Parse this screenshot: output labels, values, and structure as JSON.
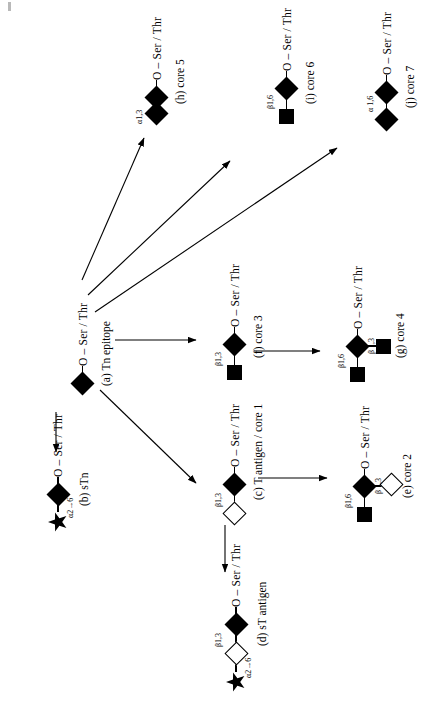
{
  "figure": {
    "type": "glycan-biosynthesis-diagram",
    "orientation": "rotated-90-ccw",
    "aglycone_label": "O – Ser / Thr",
    "symbols": {
      "filled_diamond": "GalNAc",
      "open_diamond": "Gal",
      "filled_square": "GlcNAc",
      "star": "sialic-acid"
    },
    "colors": {
      "ink": "#000000",
      "background": "#ffffff"
    }
  },
  "structures": {
    "tn": {
      "caption": "(a) Tn epitope",
      "aglycone": "O – Ser / Thr",
      "residues": [
        "filled_diamond"
      ],
      "linkages": []
    },
    "stn": {
      "caption": "(b) sTn",
      "aglycone": "O – Ser / Thr",
      "residues": [
        "star",
        "filled_diamond"
      ],
      "linkages": [
        "α2→6"
      ]
    },
    "t_antigen": {
      "caption": "(c) T antigen / core 1",
      "aglycone": "O – Ser / Thr",
      "residues": [
        "open_diamond",
        "filled_diamond"
      ],
      "linkages": [
        "β1,3"
      ]
    },
    "st_antigen": {
      "caption": "(d) sT antigen",
      "aglycone": "O – Ser / Thr",
      "residues": [
        "star",
        "open_diamond",
        "filled_diamond"
      ],
      "linkages": [
        "α2→6",
        "β1,3"
      ]
    },
    "core2": {
      "caption": "(e) core 2",
      "aglycone": "O – Ser / Thr",
      "residues": [
        "filled_square",
        "open_diamond",
        "filled_diamond"
      ],
      "linkages": [
        "β1,6",
        "β 1,3"
      ]
    },
    "core3": {
      "caption": "(f) core 3",
      "aglycone": "O – Ser / Thr",
      "residues": [
        "filled_square",
        "filled_diamond"
      ],
      "linkages": [
        "β1,3"
      ]
    },
    "core4": {
      "caption": "(g) core 4",
      "aglycone": "O – Ser / Thr",
      "residues": [
        "filled_square",
        "filled_square",
        "filled_diamond"
      ],
      "linkages": [
        "β1,6",
        "β 1,3"
      ]
    },
    "core5": {
      "caption": "(h) core 5",
      "aglycone": "O – Ser / Thr",
      "residues": [
        "filled_diamond",
        "filled_diamond"
      ],
      "linkages": [
        "α1,3"
      ]
    },
    "core6": {
      "caption": "(i) core 6",
      "aglycone": "O – Ser / Thr",
      "residues": [
        "filled_square",
        "filled_diamond"
      ],
      "linkages": [
        "β1,6"
      ]
    },
    "core7": {
      "caption": "(j) core 7",
      "aglycone": "O – Ser / Thr",
      "residues": [
        "filled_diamond",
        "filled_diamond"
      ],
      "linkages": [
        "α 1,6"
      ]
    }
  },
  "arrows": [
    {
      "name": "tn-to-core5",
      "from": "tn",
      "to": "core5"
    },
    {
      "name": "tn-to-core6",
      "from": "tn",
      "to": "core6"
    },
    {
      "name": "tn-to-core7",
      "from": "tn",
      "to": "core7"
    },
    {
      "name": "tn-to-core3",
      "from": "tn",
      "to": "core3"
    },
    {
      "name": "tn-to-t-antigen",
      "from": "tn",
      "to": "t_antigen"
    },
    {
      "name": "tn-to-stn",
      "from": "tn",
      "to": "stn"
    },
    {
      "name": "core3-to-core4",
      "from": "core3",
      "to": "core4"
    },
    {
      "name": "t-antigen-to-core2",
      "from": "t_antigen",
      "to": "core2"
    },
    {
      "name": "t-antigen-to-st-antigen",
      "from": "t_antigen",
      "to": "st_antigen"
    }
  ]
}
